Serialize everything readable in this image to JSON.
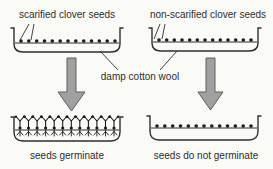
{
  "colors": {
    "background": "#fafaf7",
    "ink": "#2e2e2e",
    "seed": "#1c1c1c",
    "arrow_fill": "#a0a0a0",
    "arrow_stroke": "#5f5f5f"
  },
  "labels": {
    "top_left": "scarified clover seeds",
    "top_right": "non-scarified clover seeds",
    "middle": "damp cotton wool",
    "bottom_left": "seeds germinate",
    "bottom_right": "seeds do not germinate"
  },
  "diagram": {
    "top_left_dish": {
      "seed_count": 13
    },
    "top_right_dish": {
      "seed_count": 13
    },
    "bottom_left_dish": {
      "seedling_count": 12
    },
    "bottom_right_dish": {
      "seed_count": 13
    }
  }
}
